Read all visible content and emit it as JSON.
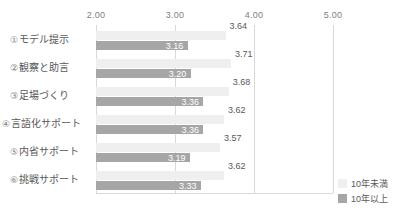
{
  "chart_data": {
    "type": "bar",
    "orientation": "horizontal",
    "title": "",
    "xlabel": "",
    "ylabel": "",
    "xlim": [
      1.0,
      5.3
    ],
    "xticks": [
      "2.00",
      "3.00",
      "4.00",
      "5.00"
    ],
    "xtick_values": [
      2.0,
      3.0,
      4.0,
      5.0
    ],
    "grid": true,
    "legend_position": "bottom-right",
    "categories": [
      "モデル提示",
      "観察と助言",
      "足場づくり",
      "言語化サポート",
      "内省サポート",
      "挑戦サポート"
    ],
    "category_numbers": [
      "①",
      "②",
      "③",
      "④",
      "⑤",
      "⑥"
    ],
    "series": [
      {
        "name": "10年未満",
        "color": "#efefef",
        "values": [
          3.64,
          3.71,
          3.68,
          3.62,
          3.57,
          3.62
        ],
        "labels": [
          "3.64",
          "3.71",
          "3.68",
          "3.62",
          "3.57",
          "3.62"
        ]
      },
      {
        "name": "10年以上",
        "color": "#a6a6a6",
        "values": [
          3.16,
          3.2,
          3.36,
          3.36,
          3.19,
          3.33
        ],
        "labels": [
          "3.16",
          "3.20",
          "3.36",
          "3.36",
          "3.19",
          "3.33"
        ]
      }
    ]
  },
  "axis": {
    "ticks": [
      {
        "label": "2.00",
        "value": 2.0
      },
      {
        "label": "3.00",
        "value": 3.0
      },
      {
        "label": "4.00",
        "value": 4.0
      },
      {
        "label": "5.00",
        "value": 5.0
      }
    ]
  },
  "legend": {
    "items": [
      {
        "label": "10年未満",
        "color": "#efefef"
      },
      {
        "label": "10年以上",
        "color": "#a6a6a6"
      }
    ]
  },
  "caption": {
    "text": ""
  },
  "colors": {
    "series_light": "#efefef",
    "series_dark": "#a6a6a6",
    "gridline": "#d9d9d9",
    "text": "#595959",
    "tick_text": "#808080"
  }
}
